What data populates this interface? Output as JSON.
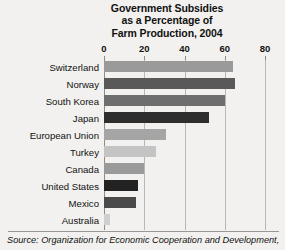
{
  "chart_data": {
    "type": "bar",
    "orientation": "horizontal",
    "title": "Government Subsidies as a Percentage of Farm Production, 2004",
    "title_lines": [
      "Government Subsidies",
      "as a Percentage of",
      "Farm Production, 2004"
    ],
    "xlabel": "",
    "ylabel": "",
    "xlim": [
      0,
      80
    ],
    "xticks": [
      0,
      20,
      40,
      60,
      80
    ],
    "xtick_labels": [
      "0",
      "20",
      "40",
      "60",
      "80"
    ],
    "grid": true,
    "grid_axis": "x",
    "legend": false,
    "categories": [
      "Switzerland",
      "Norway",
      "South Korea",
      "Japan",
      "European Union",
      "Turkey",
      "Canada",
      "United States",
      "Mexico",
      "Australia"
    ],
    "values": [
      64,
      65,
      60,
      52,
      31,
      26,
      20,
      17,
      16,
      3
    ],
    "bar_colors": [
      "#9a9a9a",
      "#595959",
      "#6e6e6e",
      "#2e2e2e",
      "#a5a5a5",
      "#c4c4c4",
      "#9a9a9a",
      "#222222",
      "#4a4a4a",
      "#cfcfcf"
    ],
    "source": "Source: Organization for Economic Cooperation and Development,"
  },
  "source_note": {
    "label": "Source:",
    "text": "Source: Organization for Economic Cooperation and Development,"
  },
  "style": {
    "background": "#f2f1ef",
    "grid_color": "#b9b7b4",
    "axis_color": "#8e8c89",
    "text_color": "#1a1a1a"
  }
}
